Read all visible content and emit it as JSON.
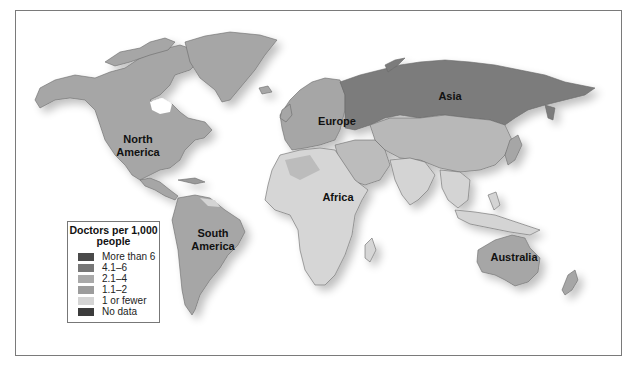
{
  "map": {
    "title": "Doctors per 1,000 people",
    "continent_labels": [
      {
        "name": "North America",
        "line1": "North",
        "line2": "America"
      },
      {
        "name": "South America",
        "line1": "South",
        "line2": "America"
      },
      {
        "name": "Europe",
        "line1": "Europe"
      },
      {
        "name": "Asia",
        "line1": "Asia"
      },
      {
        "name": "Africa",
        "line1": "Africa"
      },
      {
        "name": "Australia",
        "line1": "Australia"
      }
    ]
  },
  "legend": {
    "title_line1": "Doctors per 1,000",
    "title_line2": "people",
    "items": [
      {
        "label": "More than 6",
        "color": "#4a4a4a"
      },
      {
        "label": "4.1–6",
        "color": "#777777"
      },
      {
        "label": "2.1–4",
        "color": "#a9a9a9"
      },
      {
        "label": "1.1–2",
        "color": "#9c9c9c"
      },
      {
        "label": "1 or fewer",
        "color": "#d4d4d4"
      },
      {
        "label": "No data",
        "color": "#3c3c3c"
      }
    ]
  },
  "colors": {
    "land_default": "#a6a6a6",
    "russia": "#7b7b7b",
    "low": "#d6d6d6",
    "mid": "#bcbcbc",
    "shadow": "#e2e2e2",
    "border": "#7a7a7a"
  }
}
